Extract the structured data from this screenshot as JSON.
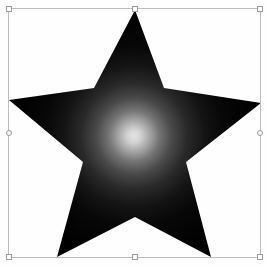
{
  "canvas": {
    "width": 268,
    "height": 266,
    "background_color": "#fefefe",
    "label": "Artboard"
  },
  "selection": {
    "label": "Selection bounding box",
    "border_color": "#bcbcbc",
    "x": 8,
    "y": 8,
    "width": 253,
    "height": 250,
    "handle_fill": "#fdfdfd",
    "handle_border": "#9a9a9a",
    "handles": [
      {
        "name": "handle-top-left",
        "position": "top-left",
        "shape": "square"
      },
      {
        "name": "handle-top-center",
        "position": "top-center",
        "shape": "square"
      },
      {
        "name": "handle-top-right",
        "position": "top-right",
        "shape": "square"
      },
      {
        "name": "handle-middle-left",
        "position": "middle-left",
        "shape": "circle"
      },
      {
        "name": "handle-middle-right",
        "position": "middle-right",
        "shape": "circle"
      },
      {
        "name": "handle-bottom-left",
        "position": "bottom-left",
        "shape": "square"
      },
      {
        "name": "handle-bottom-center",
        "position": "bottom-center",
        "shape": "square"
      },
      {
        "name": "handle-bottom-right",
        "position": "bottom-right",
        "shape": "square"
      }
    ]
  },
  "shape": {
    "name": "star-shape",
    "type": "polygon",
    "points_count": 5,
    "fill_type": "radial-gradient",
    "path": "M 135,10 L 164,88 L 261,103 L 186,162 L 211,257 L 135,217 L 57,257 L 83,162 L 9,100 L 94,88 Z",
    "vertices": [
      {
        "label": "point-top",
        "x": 135,
        "y": 10
      },
      {
        "label": "notch-upper-right",
        "x": 164,
        "y": 88
      },
      {
        "label": "point-right",
        "x": 261,
        "y": 103
      },
      {
        "label": "notch-lower-right",
        "x": 186,
        "y": 162
      },
      {
        "label": "point-bottom-right",
        "x": 211,
        "y": 257
      },
      {
        "label": "notch-bottom",
        "x": 135,
        "y": 217
      },
      {
        "label": "point-bottom-left",
        "x": 57,
        "y": 257
      },
      {
        "label": "notch-lower-left",
        "x": 83,
        "y": 162
      },
      {
        "label": "point-left",
        "x": 9,
        "y": 100
      },
      {
        "label": "notch-upper-left",
        "x": 94,
        "y": 88
      }
    ],
    "gradient": {
      "type": "radial",
      "center_x": 134,
      "center_y": 136,
      "radius": 126,
      "stops": [
        {
          "offset": "0%",
          "color": "#e4e4e4"
        },
        {
          "offset": "5%",
          "color": "#d4d4d4"
        },
        {
          "offset": "12%",
          "color": "#a8a8a8"
        },
        {
          "offset": "20%",
          "color": "#757575"
        },
        {
          "offset": "30%",
          "color": "#4a4a4a"
        },
        {
          "offset": "42%",
          "color": "#2a2a2a"
        },
        {
          "offset": "56%",
          "color": "#141414"
        },
        {
          "offset": "72%",
          "color": "#070707"
        },
        {
          "offset": "100%",
          "color": "#000000"
        }
      ]
    }
  }
}
